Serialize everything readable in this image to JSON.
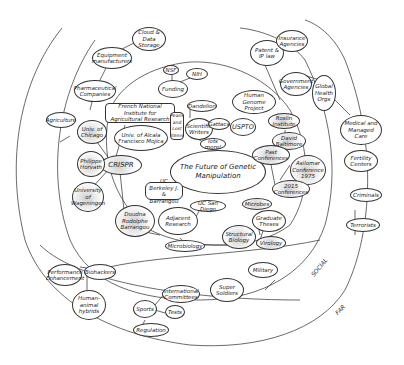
{
  "diagram": {
    "title": "The Future of Genetic Manipulation",
    "rings": [
      {
        "name": "inner",
        "label": ""
      },
      {
        "name": "social",
        "label": "SOCIAL"
      },
      {
        "name": "far",
        "label": "FAR"
      }
    ],
    "nodes": {
      "center": "The Future of Genetic Manipulation",
      "crispr": "CRISPR",
      "univ_alcala": "Univ. of Alcala Francisco Mojica",
      "french_institute": "French National Institute for Agricultural Research",
      "univ_chicago": "Univ. of Chicago",
      "philippe_horvath": "Philippe Horvath",
      "univ_wageningen": "University of Wageningen",
      "doudna_barrangou": "Doudna Rodolphe Barrangou",
      "jd_berkeley": "UC Berkeley J. & Barrangou",
      "adjacent_research": "Adjacent Research",
      "uc_san_diego": "UC San Diego",
      "microbiology": "Microbiology",
      "funding": "Funding",
      "nsf": "NSF",
      "nih": "NIH",
      "scientific_writers": "Scientific Writers",
      "dandelion": "Dandelion",
      "pearls_lost": "Pearls and Lost Items",
      "gattaca": "Gattaca",
      "lots_more": "lots more!",
      "uspto": "USPTO",
      "human_genome": "Human Genome Project",
      "roslin": "Roslin Institute",
      "david_baltimore": "David Baltimore",
      "past_conferences": "Past Conferences",
      "asilomar": "Asilomar Conference 1975",
      "conferences_2015": "2015 Conferences",
      "microbes": "Microbes",
      "graduate_theses": "Graduate Theses",
      "structural_biology": "Structural Biology",
      "virology": "Virology",
      "patent_ip": "Patent & IP law",
      "insurance": "Insurance Agencies",
      "government": "Government Agencies",
      "global_health": "Global Health Orgs",
      "medical_care": "Medical and Managed Care",
      "fertility": "Fertility Centers",
      "criminals": "Criminals",
      "terrorists": "Terrorists",
      "cloud_storage": "Cloud & Data Storage",
      "equipment": "Equipment manufacturers",
      "pharma": "Pharmaceutical Companies",
      "agriculture": "Agriculture",
      "performance": "Performance Enhancement",
      "biohackers": "Biohackers",
      "hybrids": "Human-animal hybrids",
      "sports": "Sports",
      "intl_committees": "International Committees",
      "tests": "Tests",
      "regulation": "Regulation",
      "super_soldiers": "Super Soldiers",
      "military": "Military"
    }
  }
}
